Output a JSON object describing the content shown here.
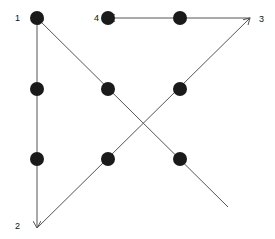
{
  "diagram": {
    "colors": {
      "dot": "#1a1a1a",
      "line": "#555555",
      "label": "#111111"
    },
    "dots": [
      {
        "x": 37,
        "y": 18
      },
      {
        "x": 108,
        "y": 18
      },
      {
        "x": 180,
        "y": 18
      },
      {
        "x": 37,
        "y": 89
      },
      {
        "x": 108,
        "y": 89
      },
      {
        "x": 180,
        "y": 89
      },
      {
        "x": 37,
        "y": 159
      },
      {
        "x": 108,
        "y": 159
      },
      {
        "x": 180,
        "y": 159
      }
    ],
    "labels": [
      {
        "text": "1",
        "x": 15,
        "y": 21
      },
      {
        "text": "2",
        "x": 15,
        "y": 229
      },
      {
        "text": "3",
        "x": 259,
        "y": 22
      },
      {
        "text": "4",
        "x": 94,
        "y": 21
      }
    ],
    "path_points": [
      {
        "x": 228,
        "y": 207
      },
      {
        "x": 37,
        "y": 18
      },
      {
        "x": 37,
        "y": 228
      },
      {
        "x": 250,
        "y": 18
      },
      {
        "x": 108,
        "y": 18
      }
    ]
  }
}
